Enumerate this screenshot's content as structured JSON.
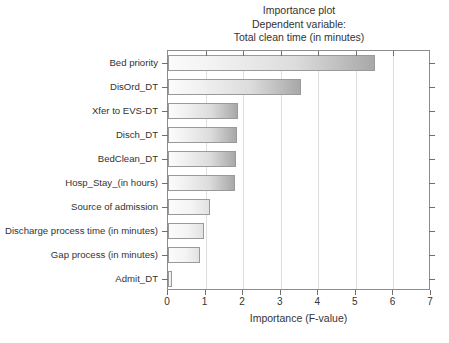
{
  "chart_data": {
    "type": "bar",
    "orientation": "horizontal",
    "title": "Importance plot",
    "subtitle": "Dependent variable:",
    "subtitle2": "Total clean time (in minutes)",
    "xlabel": "Importance (F-value)",
    "ylabel": "",
    "xlim": [
      0,
      7
    ],
    "xticks": [
      "0",
      "1",
      "2",
      "3",
      "4",
      "5",
      "6",
      "7"
    ],
    "grid": "vertical",
    "legend": "none",
    "categories": [
      "Bed priority",
      "DisOrd_DT",
      "Xfer to EVS-DT",
      "Disch_DT",
      "BedClean_DT",
      "Hosp_Stay_(in hours)",
      "Source of admission",
      "Discharge process time (in minutes)",
      "Gap process (in minutes)",
      "Admit_DT"
    ],
    "values": [
      5.5,
      3.55,
      1.85,
      1.83,
      1.82,
      1.78,
      1.13,
      0.95,
      0.85,
      0.1
    ],
    "bar_fill_start": "#fbfbfb",
    "bar_fill_end": "#a8a8a8",
    "bar_border": "#9a9a9a",
    "frame_color": "#8c8c8c",
    "gridline_color": "#dedede",
    "text_color": "#333333"
  }
}
